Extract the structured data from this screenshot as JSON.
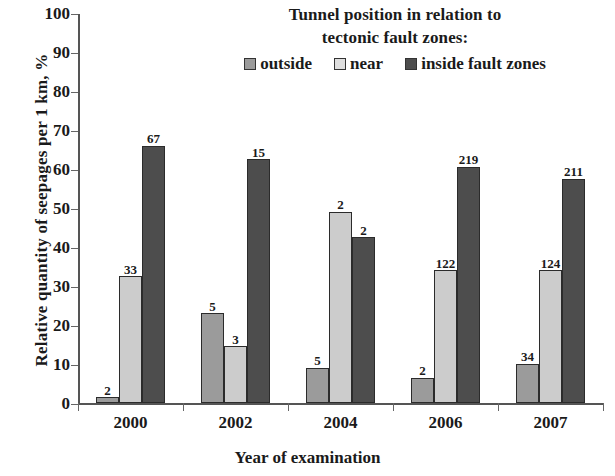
{
  "chart_data": {
    "type": "bar",
    "title": "",
    "xlabel": "Year of examination",
    "ylabel": "Relative quantity of seepages per 1 km, %",
    "categories": [
      "2000",
      "2002",
      "2004",
      "2006",
      "2007"
    ],
    "ylim": [
      0,
      100
    ],
    "yticks": [
      0,
      10,
      20,
      30,
      40,
      50,
      60,
      70,
      80,
      90,
      100
    ],
    "grid": false,
    "legend_position": "top-center",
    "legend_title": "Tunnel position in relation to tectonic fault zones:",
    "series": [
      {
        "name": "outside",
        "color": "#9b9b9b",
        "values": [
          1.5,
          23.0,
          9.0,
          6.5,
          10.0
        ],
        "labels": [
          "2",
          "5",
          "5",
          "2",
          "34"
        ]
      },
      {
        "name": "near",
        "color": "#cccccc",
        "values": [
          32.5,
          14.5,
          49.0,
          34.0,
          34.0
        ],
        "labels": [
          "33",
          "3",
          "2",
          "122",
          "124"
        ]
      },
      {
        "name": "inside fault zones",
        "color": "#4d4d4d",
        "values": [
          66.0,
          62.5,
          42.5,
          60.5,
          57.5
        ],
        "labels": [
          "67",
          "15",
          "2",
          "219",
          "211"
        ]
      }
    ]
  },
  "axis": {
    "y_tick_labels": [
      "0",
      "10",
      "20",
      "30",
      "40",
      "50",
      "60",
      "70",
      "80",
      "90",
      "100"
    ],
    "x_tick_labels": [
      "2000",
      "2002",
      "2004",
      "2006",
      "2007"
    ],
    "y_title": "Relative quantity of seepages per 1 km, %",
    "x_title": "Year of examination"
  },
  "legend": {
    "title_line_1": "Tunnel position in relation to",
    "title_line_2": "tectonic fault zones:",
    "items": [
      {
        "label": "outside",
        "swatch": "legend-swatch-outside"
      },
      {
        "label": "near",
        "swatch": "legend-swatch-near"
      },
      {
        "label": "inside fault zones",
        "swatch": "legend-swatch-inside"
      }
    ]
  },
  "colors": {
    "series_outside": "#9b9b9b",
    "series_near": "#cccccc",
    "series_inside": "#4d4d4d",
    "axis": "#555555",
    "text": "#1a1a1a",
    "background": "#ffffff"
  }
}
